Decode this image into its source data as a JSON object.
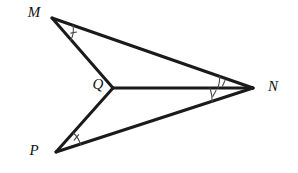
{
  "figure": {
    "background_color": "#ffffff",
    "line_color": "#1a1a1a",
    "arc_color": "#4a4a4a",
    "points": {
      "M": {
        "label": "M",
        "x": 52,
        "y": 18,
        "label_x": 34,
        "label_y": 14
      },
      "N": {
        "label": "N",
        "x": 253,
        "y": 88,
        "label_x": 273,
        "label_y": 88
      },
      "P": {
        "label": "P",
        "x": 56,
        "y": 152,
        "label_x": 34,
        "label_y": 152
      },
      "Q": {
        "label": "Q",
        "x": 113,
        "y": 88,
        "label_x": 98,
        "label_y": 86
      }
    },
    "segments": [
      {
        "name": "segment-MN",
        "from": "M",
        "to": "N",
        "path": "M 52 18 L 253 88"
      },
      {
        "name": "segment-MQ",
        "from": "M",
        "to": "Q",
        "path": "M 52 18 L 113 88"
      },
      {
        "name": "segment-QN",
        "from": "Q",
        "to": "N",
        "path": "M 113 88 L 253 88"
      },
      {
        "name": "segment-QP",
        "from": "Q",
        "to": "P",
        "path": "M 113 88 L 56 152"
      },
      {
        "name": "segment-PN",
        "from": "P",
        "to": "N",
        "path": "M 56 152 L 253 88"
      }
    ],
    "angle_marks": [
      {
        "name": "angle-arc-M",
        "at": "M",
        "between": [
          "MN",
          "MQ"
        ],
        "arc_path": "M 73 25.3 A 22 22 0 0 1 70.5 40.5",
        "tick_path": "M 76.6 32.0 L 70.9 33.1"
      },
      {
        "name": "angle-arc-MNQ",
        "at": "N",
        "between": [
          "NM",
          "NQ"
        ],
        "arc_path": "M 219.7 76.4 A 35 35 0 0 1 218 88",
        "tick_path": "M 225.0 80.5 L 222.5 85.9"
      },
      {
        "name": "angle-arc-QNP",
        "at": "N",
        "between": [
          "NQ",
          "NP"
        ],
        "arc_path": "M 210 88 A 43 43 0 0 1 212.2 101.8",
        "tick_path": "M 216.0 90.5 L 212.8 96.5"
      },
      {
        "name": "angle-arc-P",
        "at": "P",
        "between": [
          "PQ",
          "PN"
        ],
        "arc_path": "M 73.5 133.0 A 25 25 0 0 1 80.5 144.6",
        "tick_path": "M 78.6 134.6 L 74.2 140.2"
      }
    ]
  }
}
